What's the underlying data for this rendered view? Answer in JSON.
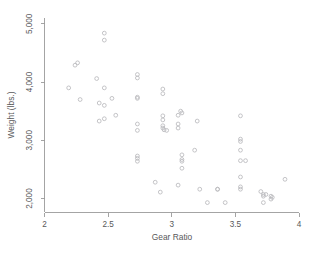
{
  "figure": {
    "background_color": "#ffffff",
    "axis_color": "#9a9a9a",
    "text_color": "#58585a",
    "marker_color": "#b9b9bd",
    "width": 318,
    "height": 255
  },
  "chart_data": {
    "type": "scatter",
    "title": "",
    "xlabel": "Gear Ratio",
    "ylabel": "Weight (lbs.)",
    "xlim": [
      2,
      4
    ],
    "ylim": [
      1760,
      5100
    ],
    "xticks": [
      2,
      2.5,
      3,
      3.5,
      4
    ],
    "xticklabels": [
      "2",
      "2.5",
      "3",
      "3.5",
      "4"
    ],
    "yticks": [
      2000,
      3000,
      4000,
      5000
    ],
    "yticklabels": [
      "2,000",
      "3,000",
      "4,000",
      "5,000"
    ],
    "grid": false,
    "legend": null,
    "marker": "circle",
    "series": [
      {
        "name": "Weight vs Gear Ratio",
        "points": [
          [
            2.19,
            3900
          ],
          [
            2.24,
            4290
          ],
          [
            2.26,
            4330
          ],
          [
            2.28,
            3700
          ],
          [
            2.41,
            4060
          ],
          [
            2.43,
            3640
          ],
          [
            2.47,
            4840
          ],
          [
            2.47,
            4720
          ],
          [
            2.47,
            3900
          ],
          [
            2.47,
            3600
          ],
          [
            2.43,
            3330
          ],
          [
            2.47,
            3370
          ],
          [
            2.53,
            3720
          ],
          [
            2.56,
            3430
          ],
          [
            2.73,
            4070
          ],
          [
            2.73,
            4130
          ],
          [
            2.73,
            3720
          ],
          [
            2.73,
            3740
          ],
          [
            2.73,
            3280
          ],
          [
            2.73,
            3170
          ],
          [
            2.73,
            2730
          ],
          [
            2.73,
            2690
          ],
          [
            2.73,
            2640
          ],
          [
            2.87,
            2280
          ],
          [
            2.91,
            2110
          ],
          [
            2.93,
            3880
          ],
          [
            2.93,
            3800
          ],
          [
            2.93,
            3420
          ],
          [
            2.93,
            3350
          ],
          [
            2.93,
            3250
          ],
          [
            2.93,
            3210
          ],
          [
            2.94,
            3180
          ],
          [
            2.96,
            3170
          ],
          [
            3.05,
            3430
          ],
          [
            3.05,
            3280
          ],
          [
            3.05,
            3210
          ],
          [
            3.07,
            3500
          ],
          [
            3.08,
            3470
          ],
          [
            3.08,
            2750
          ],
          [
            3.08,
            2670
          ],
          [
            3.08,
            2640
          ],
          [
            3.08,
            2520
          ],
          [
            3.05,
            2230
          ],
          [
            3.18,
            2830
          ],
          [
            3.2,
            3330
          ],
          [
            3.22,
            2160
          ],
          [
            3.28,
            1930
          ],
          [
            3.36,
            2160
          ],
          [
            3.36,
            2160
          ],
          [
            3.42,
            1930
          ],
          [
            3.54,
            3420
          ],
          [
            3.54,
            3020
          ],
          [
            3.54,
            2980
          ],
          [
            3.54,
            2830
          ],
          [
            3.54,
            2650
          ],
          [
            3.54,
            2370
          ],
          [
            3.54,
            2200
          ],
          [
            3.54,
            2160
          ],
          [
            3.58,
            2650
          ],
          [
            3.7,
            2120
          ],
          [
            3.72,
            2070
          ],
          [
            3.72,
            2040
          ],
          [
            3.72,
            1930
          ],
          [
            3.74,
            2070
          ],
          [
            3.78,
            2040
          ],
          [
            3.78,
            1990
          ],
          [
            3.79,
            2020
          ],
          [
            3.89,
            2330
          ]
        ]
      }
    ]
  }
}
